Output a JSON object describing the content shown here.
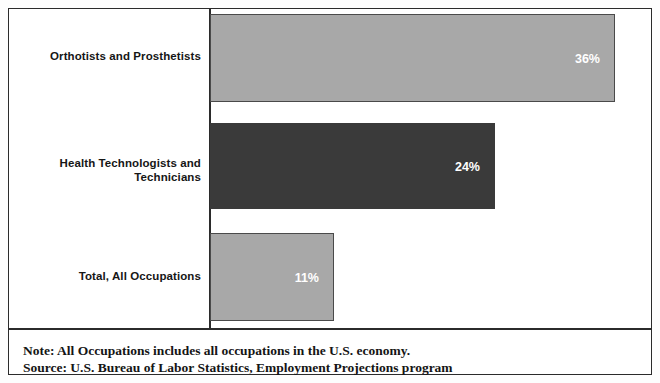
{
  "chart_data": {
    "type": "bar",
    "orientation": "horizontal",
    "title": "",
    "subtitle": "",
    "xlabel": "",
    "ylabel": "",
    "categories": [
      "Orthotists and Prosthetists",
      "Health Technologists and Technicians",
      "Total, All Occupations"
    ],
    "values": [
      36,
      24,
      11
    ],
    "value_labels": [
      "36%",
      "24%",
      "11%"
    ],
    "value_unit": "percent",
    "grid": false,
    "legend": false,
    "axis_ticks_visible": false,
    "bars": [
      {
        "category": "Orthotists and Prosthetists",
        "category_line1": "Orthotists and Prosthetists",
        "category_line2": "",
        "value": 36,
        "label": "36%",
        "color": "#a8a8a8",
        "border_color": "#4a4a4a",
        "px_width": 405,
        "px_top": 5,
        "px_height": 88,
        "label_right_px": 14,
        "label_top_px": 37,
        "cat_label_top_px": 40
      },
      {
        "category": "Health Technologists and Technicians",
        "category_line1": "Health Technologists and",
        "category_line2": "Technicians",
        "value": 24,
        "label": "24%",
        "color": "#3a3a3a",
        "border_color": "#3a3a3a",
        "px_width": 285,
        "px_top": 114,
        "px_height": 86,
        "label_right_px": 14,
        "label_top_px": 151,
        "cat_label_top_px": 147
      },
      {
        "category": "Total, All Occupations",
        "category_line1": "Total, All Occupations",
        "category_line2": "",
        "value": 11,
        "label": "11%",
        "color": "#a8a8a8",
        "border_color": "#4a4a4a",
        "px_width": 124,
        "px_top": 224,
        "px_height": 88,
        "label_right_px": 14,
        "label_top_px": 261,
        "cat_label_top_px": 260
      }
    ]
  },
  "notes": {
    "note_line": "Note: All Occupations includes all occupations in the U.S. economy.",
    "source_line": "Source: U.S. Bureau of Labor Statistics, Employment Projections program"
  },
  "colors": {
    "bar_light": "#a8a8a8",
    "bar_dark": "#3a3a3a",
    "frame": "#2b2b2b",
    "text": "#151515",
    "value_text": "#ffffff",
    "background": "#ffffff"
  }
}
